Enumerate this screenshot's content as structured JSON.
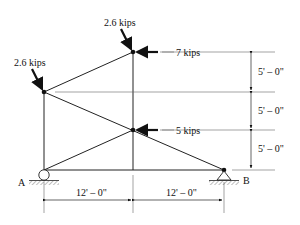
{
  "diagram": {
    "type": "truss",
    "loads": [
      {
        "id": "load-top-inclined",
        "label": "2.6 kips"
      },
      {
        "id": "load-left-inclined",
        "label": "2.6 kips"
      },
      {
        "id": "load-top-horizontal",
        "label": "7 kips"
      },
      {
        "id": "load-mid-horizontal",
        "label": "5 kips"
      }
    ],
    "supports": [
      {
        "id": "A",
        "label": "A",
        "type": "roller"
      },
      {
        "id": "B",
        "label": "B",
        "type": "pin"
      }
    ],
    "dimensions": {
      "vertical": [
        "5' – 0\"",
        "5' – 0\"",
        "5' – 0\""
      ],
      "horizontal": [
        "12' – 0\"",
        "12' – 0\""
      ]
    },
    "colors": {
      "line": "#222222",
      "thin": "#555555"
    }
  }
}
